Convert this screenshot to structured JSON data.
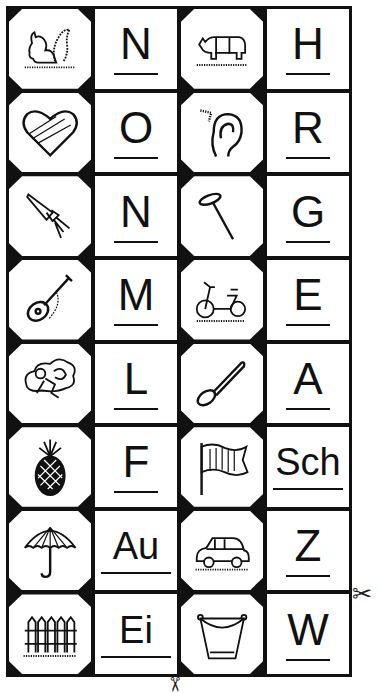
{
  "worksheet": {
    "cells": [
      {
        "type": "picture",
        "icon": "squirrel-icon",
        "word": "Eichhörnchen"
      },
      {
        "type": "letter",
        "letter": "N"
      },
      {
        "type": "picture",
        "icon": "rhino-icon",
        "word": "Nashorn"
      },
      {
        "type": "letter",
        "letter": "H"
      },
      {
        "type": "picture",
        "icon": "heart-icon",
        "word": "Herz"
      },
      {
        "type": "letter",
        "letter": "O"
      },
      {
        "type": "picture",
        "icon": "ear-icon",
        "word": "Ohr"
      },
      {
        "type": "letter",
        "letter": "R"
      },
      {
        "type": "picture",
        "icon": "rocket-icon",
        "word": "Rakete"
      },
      {
        "type": "letter",
        "letter": "N"
      },
      {
        "type": "picture",
        "icon": "nail-icon",
        "word": "Nagel"
      },
      {
        "type": "letter",
        "letter": "G"
      },
      {
        "type": "picture",
        "icon": "guitar-icon",
        "word": "Gitarre"
      },
      {
        "type": "letter",
        "letter": "M"
      },
      {
        "type": "picture",
        "icon": "moped-icon",
        "word": "Mofa"
      },
      {
        "type": "letter",
        "letter": "E"
      },
      {
        "type": "picture",
        "icon": "angel-icon",
        "word": "Engel"
      },
      {
        "type": "letter",
        "letter": "L"
      },
      {
        "type": "picture",
        "icon": "spoon-icon",
        "word": "Löffel"
      },
      {
        "type": "letter",
        "letter": "A"
      },
      {
        "type": "picture",
        "icon": "pineapple-icon",
        "word": "Ananas"
      },
      {
        "type": "letter",
        "letter": "F"
      },
      {
        "type": "picture",
        "icon": "flag-icon",
        "word": "Fahne"
      },
      {
        "type": "letter",
        "letter": "Sch"
      },
      {
        "type": "picture",
        "icon": "umbrella-icon",
        "word": "Schirm"
      },
      {
        "type": "letter",
        "letter": "Au"
      },
      {
        "type": "picture",
        "icon": "car-icon",
        "word": "Auto"
      },
      {
        "type": "letter",
        "letter": "Z"
      },
      {
        "type": "picture",
        "icon": "fence-icon",
        "word": "Zaun"
      },
      {
        "type": "letter",
        "letter": "Ei"
      },
      {
        "type": "picture",
        "icon": "bucket-icon",
        "word": "Eimer"
      },
      {
        "type": "letter",
        "letter": "W"
      }
    ],
    "scissors_glyph": "✂"
  }
}
